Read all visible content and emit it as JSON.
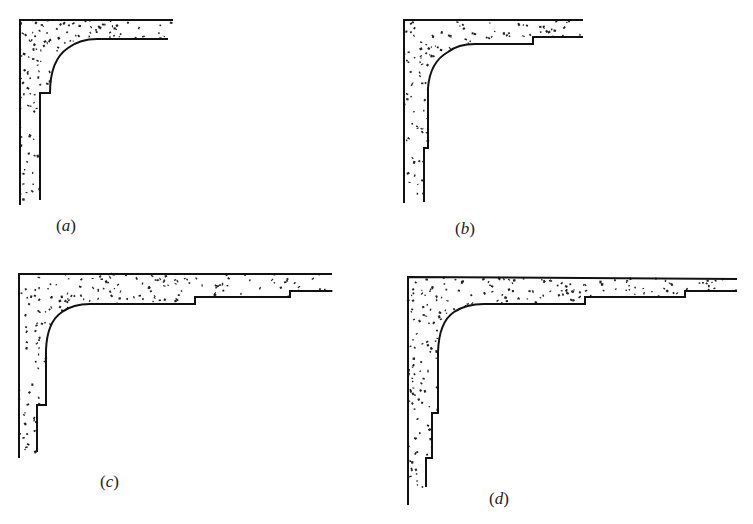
{
  "figure": {
    "background": "#ffffff",
    "ink_color": "#111111",
    "panels": [
      {
        "id": "a",
        "label": "(a)",
        "label_letter": "a",
        "label_pos": [
          56,
          216
        ],
        "outer_path": "M20,205 L20,20 L173,20",
        "inner_path": "M40,200 L40,93 L50,93 Q50,60 68,48 Q80,39 97,39 L168,39",
        "region_path": "M20,205 L20,20 L173,20 L168,39 L97,39 Q80,39 68,48 Q50,60 50,93 L40,93 L40,200 Z",
        "bbox": [
          20,
          20,
          173,
          205
        ]
      },
      {
        "id": "b",
        "label": "(b)",
        "label_letter": "b",
        "label_pos": [
          455,
          219
        ],
        "outer_path": "M404,203 L404,20 L583,20",
        "inner_path": "M424,202 L424,148 L428,148 L428,88 Q430,62 448,52 Q458,44 475,44 L533,44 L533,37 L583,37",
        "region_path": "M404,203 L404,20 L583,20 L583,37 L533,37 L533,44 L475,44 Q458,44 448,52 Q430,62 428,88 L428,148 L424,148 L424,202 Z",
        "bbox": [
          404,
          20,
          583,
          203
        ]
      },
      {
        "id": "c",
        "label": "(c)",
        "label_letter": "c",
        "label_pos": [
          100,
          472
        ],
        "outer_path": "M19,458 L19,274 L332,274",
        "inner_path": "M37,452 L37,405 L46,405 L46,350 Q47,322 62,312 Q73,304 90,304 L195,304 L195,297 L290,297 L290,291 L332,291",
        "region_path": "M19,458 L19,274 L332,274 L332,291 L290,291 L290,297 L195,297 L195,304 L90,304 Q73,304 62,312 Q47,322 46,350 L46,405 L37,405 L37,452 Z",
        "bbox": [
          19,
          274,
          332,
          458
        ]
      },
      {
        "id": "d",
        "label": "(d)",
        "label_letter": "d",
        "label_pos": [
          489,
          489
        ],
        "outer_path": "M408,505 L408,277 L737,279",
        "inner_path": "M426,487 L426,458 L432,458 L432,413 L438,413 L438,352 Q439,322 454,312 Q466,304 484,304 L585,304 L585,297 L685,297 L685,291 L737,291",
        "region_path": "M408,505 L408,277 L737,279 L737,291 L685,291 L685,297 L585,297 L585,304 L484,304 Q466,304 454,312 Q439,322 438,352 L438,413 L432,413 L432,458 L426,458 L426,487 L408,487 Z",
        "bbox": [
          408,
          277,
          737,
          505
        ]
      }
    ]
  }
}
